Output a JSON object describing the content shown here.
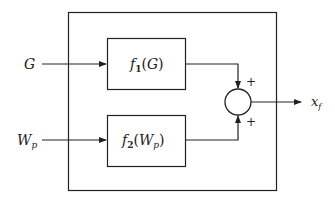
{
  "diagram": {
    "inputs": [
      {
        "main": "G",
        "sub": ""
      },
      {
        "main": "W",
        "sub": "p"
      }
    ],
    "blocks": [
      {
        "fn": "f",
        "idx": "1",
        "arg_main": "G",
        "arg_sub": ""
      },
      {
        "fn": "f",
        "idx": "2",
        "arg_main": "W",
        "arg_sub": "p"
      }
    ],
    "summer_signs": [
      "+",
      "+"
    ],
    "output": {
      "main": "x",
      "sub": "f"
    },
    "colors": {
      "line": "#222222",
      "background": "#ffffff"
    }
  }
}
